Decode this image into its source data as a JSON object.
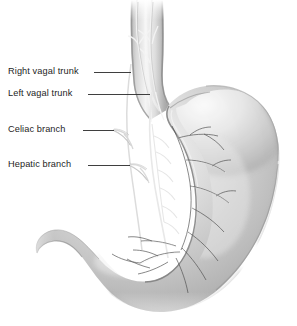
{
  "figure": {
    "style": "grayscale airbrush medical illustration",
    "background_color": "#ffffff",
    "width": 297,
    "height": 326
  },
  "palette": {
    "text": "#1d1d1d",
    "leader_line": "#2a2a2a",
    "organ_light": "#f2f2f2",
    "organ_mid": "#c0c0c0",
    "organ_dark": "#8d8d8d",
    "organ_edge": "#6f6f6f",
    "nerve_light": "#efefef",
    "nerve_dark": "#4a4a4a"
  },
  "labels": [
    {
      "id": "right-vagal-trunk",
      "text": "Right vagal trunk",
      "text_x": 8,
      "text_y": 66,
      "leader": {
        "x1": 94,
        "y1": 72,
        "x2": 131,
        "y2": 72
      }
    },
    {
      "id": "left-vagal-trunk",
      "text": "Left vagal trunk",
      "text_x": 8,
      "text_y": 88,
      "leader": {
        "x1": 88,
        "y1": 94,
        "x2": 150,
        "y2": 94
      }
    },
    {
      "id": "celiac-branch",
      "text": "Celiac branch",
      "text_x": 8,
      "text_y": 124,
      "leader": {
        "x1": 83,
        "y1": 130,
        "x2": 114,
        "y2": 130
      }
    },
    {
      "id": "hepatic-branch",
      "text": "Hepatic branch",
      "text_x": 8,
      "text_y": 159,
      "leader": {
        "x1": 88,
        "y1": 165,
        "x2": 130,
        "y2": 165
      }
    }
  ],
  "anatomy": {
    "esophagus": "vertical tube at top center, x 128-165",
    "cardia": "junction at y 95-125",
    "fundus": "upper right bulge peaking near x 250, y 95",
    "body": "widest at right edge x 278, y 160",
    "antrum": "curves left and down toward y 300",
    "pylorus": "narrow neck at left, x 38-70, y 235-265",
    "lesser_curvature": "inner right-facing concave border x 168-180",
    "greater_curvature": "outer convex border to the right and below"
  }
}
